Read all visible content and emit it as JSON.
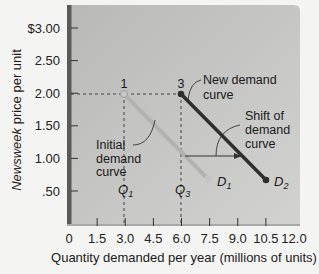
{
  "chart_data": {
    "type": "line",
    "title": "",
    "xlabel": "Quantity demanded per year (millions of units)",
    "ylabel_italic": "Newsweek",
    "ylabel_rest": " price per unit",
    "ylabel": "Newsweek price per unit",
    "x_ticks": [
      "0",
      "1.5",
      "3.0",
      "4.5",
      "6.0",
      "7.5",
      "9.0",
      "10.5",
      "12.0"
    ],
    "x_tick_values": [
      0,
      1.5,
      3.0,
      4.5,
      6.0,
      7.5,
      9.0,
      10.5,
      12.0
    ],
    "y_ticks": [
      "$3.00",
      "2.50",
      "2.00",
      "1.50",
      "1.00",
      ".50"
    ],
    "y_tick_values": [
      3.0,
      2.5,
      2.0,
      1.5,
      1.0,
      0.5
    ],
    "xlim": [
      0,
      12.5
    ],
    "ylim": [
      0,
      3.35
    ],
    "grid": false,
    "series": [
      {
        "name": "D1",
        "label": "Initial demand curve",
        "color": "#b2b2b2",
        "points": [
          {
            "x": 3.0,
            "y": 2.0
          },
          {
            "x": 7.5,
            "y": 0.65
          }
        ]
      },
      {
        "name": "D2",
        "label": "New demand curve",
        "color": "#2e2e2e",
        "points": [
          {
            "x": 6.0,
            "y": 2.0
          },
          {
            "x": 10.5,
            "y": 0.65
          }
        ]
      }
    ],
    "annotations": {
      "point1": {
        "label": "1",
        "x": 3.0,
        "y": 2.0
      },
      "point3": {
        "label": "3",
        "x": 6.0,
        "y": 2.0
      },
      "q1": {
        "label": "Q",
        "sub": "1",
        "x": 3.0
      },
      "q3": {
        "label": "Q",
        "sub": "3",
        "x": 6.0
      },
      "d1": {
        "label": "D",
        "sub": "1"
      },
      "d2": {
        "label": "D",
        "sub": "2"
      },
      "new_curve": [
        "New demand",
        "curve"
      ],
      "initial_curve": [
        "Initial",
        "demand",
        "curve"
      ],
      "shift": [
        "Shift of",
        "demand",
        "curve"
      ],
      "shift_arrow": {
        "from_x": 6.1,
        "to_x": 9.3,
        "y": 1.07
      }
    }
  },
  "colors": {
    "plot_bg_top": "#bdbdbb",
    "plot_bg_bottom": "#cfcfcd",
    "axis_bar": "#5a5a5a",
    "d1": "#b2b2b2",
    "d2": "#2e2e2e"
  }
}
